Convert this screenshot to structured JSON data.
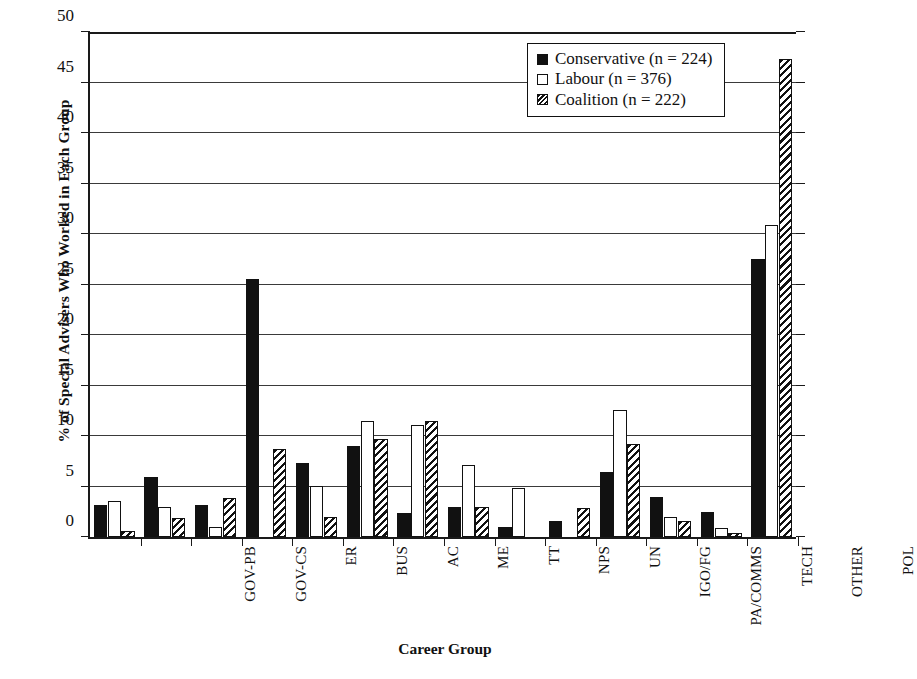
{
  "chart_data": {
    "type": "bar",
    "title": "",
    "xlabel": "Career Group",
    "ylabel": "% of Special Advisers Who Worked in Each Group",
    "ylim": [
      0,
      50
    ],
    "yticks": [
      0,
      5,
      10,
      15,
      20,
      25,
      30,
      35,
      40,
      45,
      50
    ],
    "grid": true,
    "legend_position": "top-right",
    "categories": [
      "GOV-PB",
      "GOV-CS",
      "ER",
      "BUS",
      "AC",
      "ME",
      "TT",
      "NPS",
      "UN",
      "IGO/FG",
      "PA/COMMS",
      "TECH",
      "OTHER",
      "POL"
    ],
    "series": [
      {
        "name": "Conservative (n = 224)",
        "short_name": "Conservative",
        "n": 224,
        "fill": "solid-black",
        "color": "#111111",
        "values": [
          3.2,
          5.9,
          3.2,
          25.4,
          7.3,
          9.0,
          2.4,
          3.0,
          1.0,
          1.6,
          6.4,
          3.9,
          2.5,
          27.4
        ]
      },
      {
        "name": "Labour (n = 376)",
        "short_name": "Labour",
        "n": 376,
        "fill": "white",
        "color": "#ffffff",
        "values": [
          3.6,
          3.0,
          1.0,
          0,
          5.0,
          11.4,
          11.0,
          7.1,
          4.8,
          0,
          12.5,
          2.0,
          0.9,
          30.8
        ]
      },
      {
        "name": "Coalition (n = 222)",
        "short_name": "Coalition",
        "n": 222,
        "fill": "diagonal-hatch",
        "color": "#111111",
        "values": [
          0.6,
          1.9,
          3.8,
          8.7,
          2.0,
          9.7,
          11.4,
          3.0,
          0,
          2.9,
          9.2,
          1.6,
          0.4,
          47.1
        ]
      }
    ]
  },
  "legend": {
    "entries": [
      {
        "label": "Conservative (n = 224)"
      },
      {
        "label": "Labour (n = 376)"
      },
      {
        "label": "Coalition (n = 222)"
      }
    ]
  },
  "axes": {
    "y_title": "% of Special Advisers Who Worked in Each Group",
    "x_title": "Career Group",
    "y_tick_labels": [
      "0",
      "5",
      "10",
      "15",
      "20",
      "25",
      "30",
      "35",
      "40",
      "45",
      "50"
    ]
  }
}
